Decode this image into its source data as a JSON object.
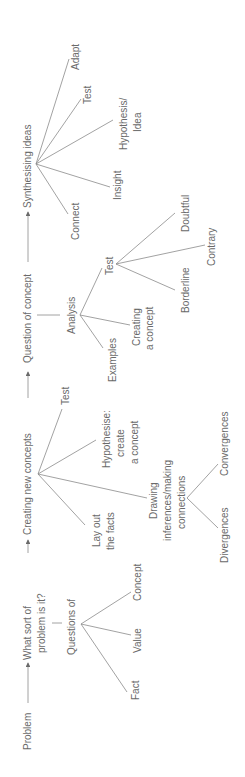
{
  "diagram": {
    "orientation": "rotated-90-ccw",
    "main_flow": {
      "problem": "Problem",
      "what_sort_line1": "What sort of",
      "what_sort_line2": "problem is it?",
      "creating_new_concepts": "Creating new concepts",
      "question_of_concept": "Question of concept",
      "synthesising_ideas": "Synthesising ideas"
    },
    "questions_branch": {
      "label": "Questions of",
      "children": [
        "Fact",
        "Value",
        "Concept"
      ]
    },
    "creating_branch": {
      "test": "Test",
      "hypothesise_line1": "Hypothesise:",
      "hypothesise_line2": "create",
      "hypothesise_line3": "a concept",
      "layout_line1": "Lay out",
      "layout_line2": "the facts",
      "drawing_line1": "Drawing",
      "drawing_line2": "inferences/making",
      "drawing_line3": "connections",
      "convergences": "Convergences",
      "divergences": "Divergences"
    },
    "analysis_branch": {
      "label": "Analysis",
      "examples": "Examples",
      "creating_line1": "Creating",
      "creating_line2": "a concept",
      "test": "Test",
      "doubtful": "Doubtful",
      "contrary": "Contrary",
      "borderline": "Borderline"
    },
    "synthesising_branch": {
      "adapt": "Adapt",
      "test": "Test",
      "hypothesis_line1": "Hypothesis/",
      "hypothesis_line2": "Idea",
      "insight": "Insight",
      "connect": "Connect"
    },
    "colors": {
      "text": "#6a6a6a",
      "line": "#8a8a8a",
      "background": "#ffffff"
    }
  }
}
